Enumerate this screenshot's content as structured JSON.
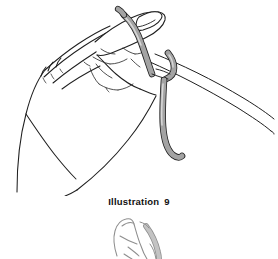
{
  "document": {
    "figure_caption_label": "Illustration",
    "figure_caption_number": "9",
    "background_color": "#ffffff",
    "ink_color": "#1a1a1a",
    "yarn_fill_color": "#a3a3a3",
    "yarn_highlight_color": "#d9d9d9",
    "secondary_figure_ink_color": "#8e8e8e"
  },
  "main_illustration": {
    "subject": "left hand holding yarn looped over index finger with crochet hook",
    "parts": [
      {
        "name": "hand-outline",
        "description": "side view of a hand, fingers curled, thumb to the left"
      },
      {
        "name": "index-finger",
        "description": "extended index finger at top with fingernail"
      },
      {
        "name": "yarn-loop-over-finger",
        "description": "grey yarn band wrapped around the index finger"
      },
      {
        "name": "yarn-loop-over-hook",
        "description": "grey yarn band wrapped over the crochet hook shaft"
      },
      {
        "name": "yarn-tail",
        "description": "grey yarn strand hanging down and curving right"
      },
      {
        "name": "crochet-hook",
        "description": "thin double-line hook shaft running to the lower right"
      },
      {
        "name": "palm-creases",
        "description": "short interior lines indicating knuckles and palm folds"
      }
    ]
  },
  "secondary_illustration": {
    "subject": "partial cropped sketch of a hand with yarn, continued below",
    "parts": [
      {
        "name": "partial-hand-outline",
        "description": "faint light-grey upper portion of a second hand sketch"
      },
      {
        "name": "partial-yarn",
        "description": "faint yarn strand along the right side of the partial hand"
      }
    ]
  }
}
